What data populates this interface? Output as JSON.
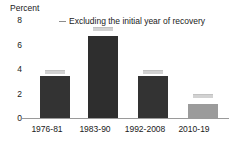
{
  "chart_data": {
    "type": "bar",
    "title": "",
    "subtitle": "",
    "xlabel": "",
    "ylabel": "Percent",
    "ylim": [
      0,
      8
    ],
    "yticks": [
      "0",
      "2",
      "4",
      "6",
      "8"
    ],
    "ytick_values": [
      0,
      2,
      4,
      6,
      8
    ],
    "grid": false,
    "categories": [
      "1976-81",
      "1983-90",
      "1992-2008",
      "2010-19"
    ],
    "series": [
      {
        "name": "Average growth",
        "values": [
          3.4,
          6.6,
          3.35,
          1.15
        ],
        "colors": [
          "#333333",
          "#2e2e2e",
          "#333333",
          "#9b9b9b"
        ]
      },
      {
        "name": "Excluding the initial year of recovery",
        "values": [
          3.55,
          6.95,
          3.5,
          1.6
        ],
        "color": "#d2d2d2"
      }
    ],
    "legend": {
      "position": "top",
      "entries": [
        {
          "label": "Excluding the initial year of recovery",
          "marker": "dash",
          "color": "#8c8c8c"
        }
      ]
    }
  },
  "axis": {
    "y_title": "Percent"
  }
}
